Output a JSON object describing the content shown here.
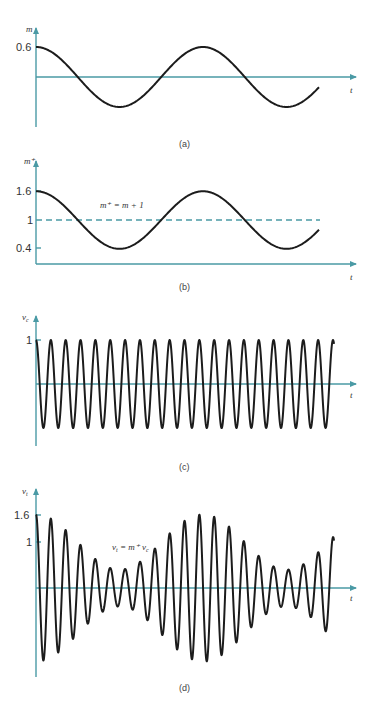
{
  "figure": {
    "colors": {
      "axis": "#4a9aa5",
      "curve": "#1c1c1c"
    },
    "panels": [
      {
        "id": "a",
        "caption": "(a)",
        "y_axis_label": "m",
        "x_axis_label": "t",
        "ticks": [
          {
            "label": "0.6",
            "value": 0.6
          }
        ],
        "formula": ""
      },
      {
        "id": "b",
        "caption": "(b)",
        "y_axis_label": "m⁺",
        "x_axis_label": "t",
        "ticks": [
          {
            "label": "1.6",
            "value": 1.6
          },
          {
            "label": "1",
            "value": 1
          },
          {
            "label": "0.4",
            "value": 0.4
          }
        ],
        "formula": "m⁺ = m + 1"
      },
      {
        "id": "c",
        "caption": "(c)",
        "y_axis_label": "v",
        "y_axis_sub": "c",
        "x_axis_label": "t",
        "ticks": [
          {
            "label": "1",
            "value": 1
          }
        ],
        "formula": ""
      },
      {
        "id": "d",
        "caption": "(d)",
        "y_axis_label": "v",
        "y_axis_sub": "t",
        "x_axis_label": "t",
        "ticks": [
          {
            "label": "1.6",
            "value": 1.6
          },
          {
            "label": "1",
            "value": 1
          }
        ],
        "formula": "v",
        "formula_sub1": "t",
        "formula_mid": " = m⁺ v",
        "formula_sub2": "c"
      }
    ]
  },
  "chart_data": [
    {
      "type": "line",
      "title": "(a) Modulating signal m(t)",
      "xlabel": "t",
      "ylabel": "m",
      "function": "m(t) = 0.6 cos(2π t / T_m)",
      "amplitude": 0.6,
      "cycles_shown": 1.75,
      "ylim": [
        -0.6,
        0.6
      ],
      "tick_labels": [
        "0.6"
      ]
    },
    {
      "type": "line",
      "title": "(b) Offset modulating signal m⁺(t)",
      "xlabel": "t",
      "ylabel": "m⁺",
      "function": "m⁺(t) = m(t) + 1",
      "reference_line": {
        "y": 1,
        "style": "dashed"
      },
      "ylim": [
        0.4,
        1.6
      ],
      "tick_labels": [
        "1.6",
        "1",
        "0.4"
      ],
      "annotation": "m⁺ = m + 1"
    },
    {
      "type": "line",
      "title": "(c) Carrier v_c(t)",
      "xlabel": "t",
      "ylabel": "v_c",
      "function": "v_c(t) = cos(2π t / T_c)",
      "amplitude": 1,
      "cycles_shown": 20.2,
      "ylim": [
        -1,
        1
      ],
      "tick_labels": [
        "1"
      ]
    },
    {
      "type": "line",
      "title": "(d) AM signal v_t(t)",
      "xlabel": "t",
      "ylabel": "v_t",
      "function": "v_t(t) = m⁺(t) · v_c(t)",
      "envelope_max": 1.6,
      "envelope_min": 0.4,
      "ylim": [
        -1.6,
        1.6
      ],
      "tick_labels": [
        "1.6",
        "1"
      ],
      "annotation": "v_t = m⁺ v_c"
    }
  ]
}
